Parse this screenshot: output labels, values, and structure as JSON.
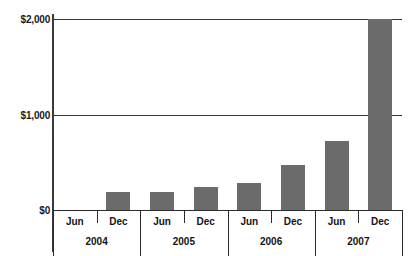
{
  "chart_data": {
    "type": "bar",
    "title": "",
    "subtitle": "",
    "xlabel": "",
    "ylabel": "",
    "grid": true,
    "legend": null,
    "ylim": [
      0,
      2000
    ],
    "yticks": [
      0,
      1000,
      2000
    ],
    "ytick_labels": [
      "$0",
      "$1,000",
      "$2,000"
    ],
    "categories": [
      "Jun",
      "Dec",
      "Jun",
      "Dec",
      "Jun",
      "Dec",
      "Jun",
      "Dec"
    ],
    "values": [
      0,
      190,
      190,
      240,
      280,
      470,
      720,
      2000
    ],
    "groups": [
      {
        "label": "2004",
        "months": [
          "Jun",
          "Dec"
        ]
      },
      {
        "label": "2005",
        "months": [
          "Jun",
          "Dec"
        ]
      },
      {
        "label": "2006",
        "months": [
          "Jun",
          "Dec"
        ]
      },
      {
        "label": "2007",
        "months": [
          "Jun",
          "Dec"
        ]
      }
    ],
    "bar_color": "#6b6b6b",
    "axis_color": "#2b2b2b",
    "grid_color": "#3a3a3a",
    "background": "#ffffff"
  }
}
